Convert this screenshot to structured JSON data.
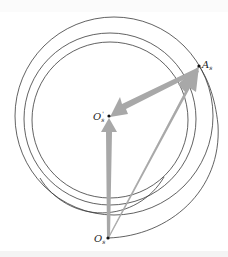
{
  "figure": {
    "type": "geometric-diagram",
    "colors": {
      "background": "#ffffff",
      "line": "#333333",
      "arrow": "#a8a8a8",
      "point": "#111111"
    },
    "points": {
      "O_s_prime": {
        "label": "O",
        "sub": "s",
        "sup": "'",
        "x": 109,
        "y": 116
      },
      "A_s": {
        "label": "A",
        "sub": "s",
        "x": 199,
        "y": 66
      },
      "O_s": {
        "label": "O",
        "sub": "s",
        "x": 108,
        "y": 238
      }
    },
    "circles": [
      {
        "name": "outer",
        "cx": 116,
        "cy": 116,
        "r": 100
      },
      {
        "name": "middle",
        "cx": 110,
        "cy": 119,
        "r": 86
      },
      {
        "name": "inner",
        "cx": 110,
        "cy": 120,
        "r": 78
      }
    ],
    "arrows": [
      {
        "from": "O_s",
        "to": "O_s_prime",
        "style": "thick"
      },
      {
        "from": "O_s",
        "to": "A_s",
        "style": "tapered"
      },
      {
        "from": "A_s",
        "to": "O_s_prime",
        "style": "thick"
      }
    ],
    "caption_clipped": ""
  }
}
